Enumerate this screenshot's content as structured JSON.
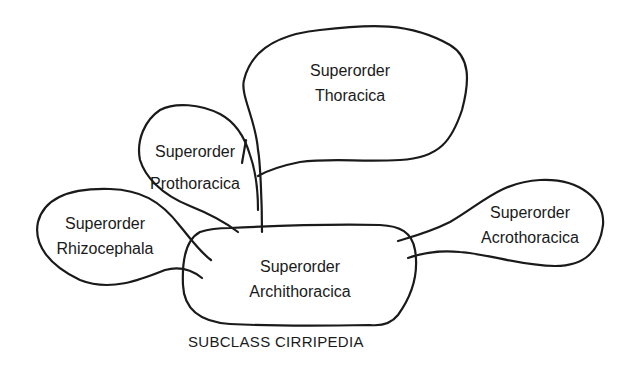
{
  "diagram": {
    "caption": "SUBCLASS CIRRIPEDIA",
    "nodes": {
      "thoracica": {
        "line1": "Superorder",
        "line2": "Thoracica"
      },
      "prothoracica": {
        "line1": "Superorder",
        "line2": "Prothoracica"
      },
      "rhizocephala": {
        "line1": "Superorder",
        "line2": "Rhizocephala"
      },
      "archithoracica": {
        "line1": "Superorder",
        "line2": "Archithoracica"
      },
      "acrothoracica": {
        "line1": "Superorder",
        "line2": "Acrothoracica"
      }
    },
    "relations": [
      {
        "from": "archithoracica",
        "to": "thoracica"
      },
      {
        "from": "archithoracica",
        "to": "prothoracica"
      },
      {
        "from": "archithoracica",
        "to": "rhizocephala"
      },
      {
        "from": "archithoracica",
        "to": "acrothoracica"
      }
    ],
    "colors": {
      "stroke": "#1a1a1a",
      "background": "#ffffff"
    }
  }
}
